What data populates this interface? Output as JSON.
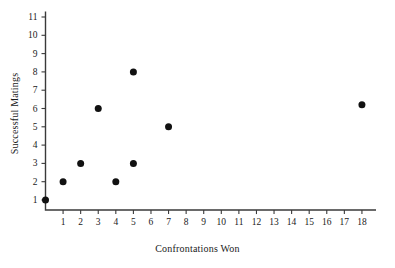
{
  "chart_data": {
    "type": "scatter",
    "title": "",
    "xlabel": "Confrontations Won",
    "ylabel": "Successful Matings",
    "xlim": [
      0,
      18.8
    ],
    "ylim": [
      0.45,
      11.3
    ],
    "grid": false,
    "legend": null,
    "xticks": [
      1,
      2,
      3,
      4,
      5,
      6,
      7,
      8,
      9,
      10,
      11,
      12,
      13,
      14,
      15,
      16,
      17,
      18
    ],
    "yticks": [
      1,
      2,
      3,
      4,
      5,
      6,
      7,
      8,
      9,
      10,
      11
    ],
    "xtick_labels": [
      "1",
      "2",
      "3",
      "4",
      "5",
      "6",
      "7",
      "8",
      "9",
      "10",
      "11",
      "12",
      "13",
      "14",
      "15",
      "16",
      "17",
      "18"
    ],
    "ytick_labels": [
      "1",
      "2",
      "3",
      "4",
      "5",
      "6",
      "7",
      "8",
      "9",
      "10",
      "11"
    ],
    "marker": "filled-circle",
    "marker_color": "#111111",
    "marker_size": 4.6,
    "points": [
      {
        "x": 0,
        "y": 1
      },
      {
        "x": 1,
        "y": 2
      },
      {
        "x": 2,
        "y": 3
      },
      {
        "x": 3,
        "y": 6
      },
      {
        "x": 4,
        "y": 2
      },
      {
        "x": 5,
        "y": 3
      },
      {
        "x": 5,
        "y": 8
      },
      {
        "x": 7,
        "y": 5
      },
      {
        "x": 18,
        "y": 6.2
      }
    ]
  },
  "figure": {
    "background": "#ffffff",
    "axis_color": "#3a3a3a",
    "text_color": "#1a1a1a"
  }
}
